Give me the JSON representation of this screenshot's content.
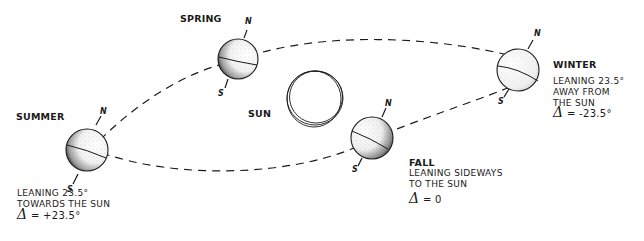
{
  "diagram": {
    "sun": {
      "label": "SUN"
    },
    "seasons": {
      "summer": {
        "label": "SUMMER",
        "north": "N",
        "south": "S",
        "desc_line1": "LEANING 23.5°",
        "desc_line2": "TOWARDS THE SUN",
        "delta_symbol": "δ",
        "delta_value": "= +23.5°"
      },
      "spring": {
        "label": "SPRING",
        "north": "N",
        "south": "S"
      },
      "fall": {
        "label": "FALL",
        "north": "N",
        "south": "S",
        "desc_line1": "LEANING SIDEWAYS",
        "desc_line2": "TO THE SUN",
        "delta_symbol": "δ",
        "delta_value": "= 0"
      },
      "winter": {
        "label": "WINTER",
        "north": "N",
        "south": "S",
        "desc_line1": "LEANING 23.5°",
        "desc_line2": "AWAY FROM",
        "desc_line3": "THE SUN",
        "delta_symbol": "δ",
        "delta_value": "= -23.5°"
      }
    },
    "colors": {
      "ink": "#1a1a1a",
      "background": "#ffffff"
    }
  }
}
